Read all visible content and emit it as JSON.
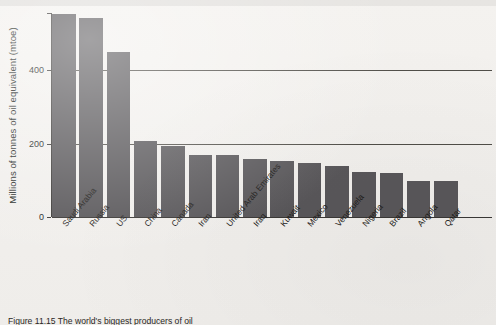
{
  "chart_data": {
    "type": "bar",
    "title": "",
    "xlabel": "",
    "ylabel": "Millions of tonnes of oil equivalent (mtoe)",
    "ylim": [
      0,
      600
    ],
    "yticks": [
      0,
      200,
      400
    ],
    "ytick_labels": [
      "0",
      "200",
      "400"
    ],
    "grid": true,
    "gridlines_at": [
      200,
      400
    ],
    "legend": null,
    "bar_color": "#59575a",
    "categories": [
      "Saudi Arabia",
      "Russia",
      "US",
      "China",
      "Canada",
      "Iran",
      "United Arab Emirates",
      "Iraq",
      "Kuwait",
      "Mexico",
      "Venezuela",
      "Nigeria",
      "Brazil",
      "Angola",
      "Qatar"
    ],
    "values": [
      553,
      542,
      450,
      208,
      194,
      170,
      170,
      157,
      153,
      146,
      140,
      122,
      120,
      99,
      99
    ]
  },
  "caption": {
    "text": "Figure 11.15 The world's biggest producers of oil"
  },
  "axis": {
    "y_title": "Millions of tonnes of oil equivalent (mtoe)"
  }
}
